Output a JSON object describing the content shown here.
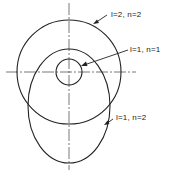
{
  "diagram": {
    "title": "",
    "type": "orbital shapes overlay",
    "labels": [
      {
        "id": "l2n2",
        "text": "l=2, n=2",
        "l": "l",
        "l_val": "2",
        "n_val": "2"
      },
      {
        "id": "l1n1",
        "text": "l=1, n=1",
        "l": "l",
        "l_val": "1",
        "n_val": "1"
      },
      {
        "id": "l1n2",
        "text": "l=1, n=2",
        "l": "l",
        "l_val": "1",
        "n_val": "2"
      }
    ],
    "shapes": [
      {
        "name": "circle-l2-n2",
        "kind": "circle",
        "cx": 69,
        "cy": 72,
        "r": 52
      },
      {
        "name": "circle-l1-n1",
        "kind": "circle",
        "cx": 69,
        "cy": 72,
        "r": 13
      },
      {
        "name": "ellipse-l1-n2",
        "kind": "ellipse",
        "cx": 69,
        "cy": 106,
        "rx": 41,
        "ry": 57
      }
    ],
    "colors": {
      "stroke": "#222222",
      "axis": "#555555",
      "background": "#ffffff"
    }
  }
}
